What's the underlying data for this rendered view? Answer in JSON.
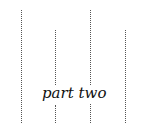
{
  "diagram": {
    "label": "part two",
    "lines": [
      {
        "name": "dotted-line-1"
      },
      {
        "name": "dotted-line-2"
      },
      {
        "name": "dotted-line-3"
      },
      {
        "name": "dotted-line-4"
      }
    ]
  }
}
